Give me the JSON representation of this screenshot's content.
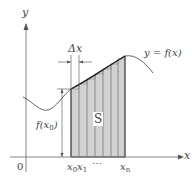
{
  "diagram": {
    "type": "riemann-sum-area-under-curve",
    "axes": {
      "x_label": "x",
      "y_label": "y",
      "origin_label": "0"
    },
    "curve_label": "y = f(x)",
    "region_label": "S",
    "height_label": "f(x0)",
    "height_label_parts": {
      "f": "f(",
      "var": "x",
      "sub": "0",
      "close": ")"
    },
    "width_label": "Δx",
    "tick_labels": {
      "x0": {
        "var": "x",
        "sub": "0"
      },
      "x1": {
        "var": "x",
        "sub": "1"
      },
      "ellipsis": "⋯",
      "xn": {
        "var": "x",
        "sub": "n"
      }
    },
    "strip_count": 7,
    "colors": {
      "region_fill": "#cfcfcf",
      "strip_line": "#888888",
      "axis": "#777777",
      "curve": "#555555",
      "outline": "#333333",
      "label": "#444444"
    }
  }
}
